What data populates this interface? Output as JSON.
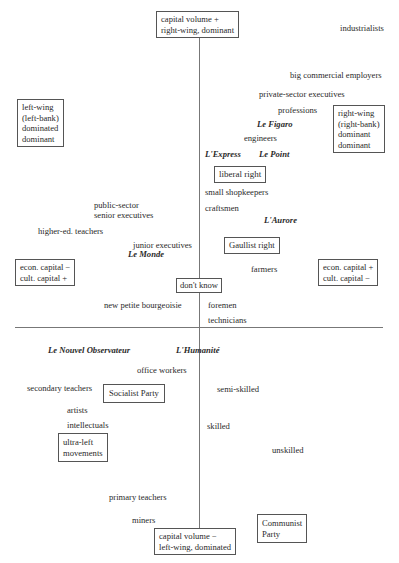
{
  "axes": {
    "top": [
      "capital volume +",
      "right-wing, dominant"
    ],
    "bottom": [
      "capital volume −",
      "left-wing, dominated"
    ],
    "left_mid": [
      "econ. capital −",
      "cult. capital +"
    ],
    "right_mid": [
      "econ. capital +",
      "cult. capital −"
    ],
    "left_upper": [
      "left-wing",
      "(left-bank)",
      "dominated",
      "dominant"
    ],
    "right_upper": [
      "right-wing",
      "(right-bank)",
      "dominant",
      "dominant"
    ]
  },
  "occupations": {
    "industrialists": "industrialists",
    "big_commercial": "big commercial employers",
    "private_exec": "private-sector executives",
    "professions": "professions",
    "engineers": "engineers",
    "small_shopkeepers": "small shopkeepers",
    "craftsmen": "craftsmen",
    "public_exec_1": "public-sector",
    "public_exec_2": "senior executives",
    "higher_ed": "higher-ed. teachers",
    "junior_exec": "junior executives",
    "farmers": "farmers",
    "new_petite": "new petite bourgeoisie",
    "foremen": "foremen",
    "technicians": "technicians",
    "office_workers": "office workers",
    "secondary_teachers": "secondary teachers",
    "semi_skilled": "semi-skilled",
    "artists": "artists",
    "intellectuals": "intellectuals",
    "skilled": "skilled",
    "unskilled": "unskilled",
    "primary_teachers": "primary teachers",
    "miners": "miners"
  },
  "newspapers": {
    "figaro": "Le Figaro",
    "express": "L'Express",
    "point": "Le Point",
    "aurore": "L'Aurore",
    "monde": "Le Monde",
    "nouvel_obs": "Le Nouvel Observateur",
    "humanite": "L'Humanité"
  },
  "parties": {
    "liberal_right": "liberal right",
    "gaullist_right": "Gaullist right",
    "dont_know": "don't know",
    "socialist": "Socialist Party",
    "ultra_left": [
      "ultra-left",
      "movements"
    ],
    "communist": [
      "Communist",
      "Party"
    ]
  }
}
